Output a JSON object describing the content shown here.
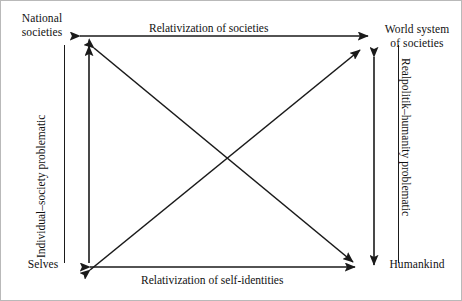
{
  "figure": {
    "type": "conceptual-quadrant-diagram",
    "background_color": "#ffffff",
    "line_color": "#1a1a1a",
    "border_color": "#b9b9b9"
  },
  "nodes": {
    "top_left": "National\nsocieties",
    "top_left_line1": "National",
    "top_left_line2": "societies",
    "top_right_line1": "World system",
    "top_right_line2": "of societies",
    "bottom_left": "Selves",
    "bottom_right": "Humankind"
  },
  "edge_labels": {
    "top": "Relativization of societies",
    "bottom": "Relativization of self-identities",
    "left": "Individual–society problematic",
    "right": "Realpolitik–humanity problematic"
  },
  "connections": [
    {
      "name": "top-edge",
      "from": "National societies",
      "to": "World system of societies",
      "arrows": "both",
      "label": "Relativization of societies"
    },
    {
      "name": "bottom-edge",
      "from": "Selves",
      "to": "Humankind",
      "arrows": "both",
      "label": "Relativization of self-identities"
    },
    {
      "name": "left-edge",
      "from": "Selves",
      "to": "National societies",
      "arrows": "both",
      "label": "Individual–society problematic"
    },
    {
      "name": "right-edge",
      "from": "Humankind",
      "to": "World system of societies",
      "arrows": "both",
      "label": "Realpolitik–humanity problematic"
    },
    {
      "name": "diagonal-tl-br",
      "from": "National societies",
      "to": "Humankind",
      "arrows": "both",
      "label": ""
    },
    {
      "name": "diagonal-bl-tr",
      "from": "Selves",
      "to": "World system of societies",
      "arrows": "both",
      "label": ""
    }
  ]
}
